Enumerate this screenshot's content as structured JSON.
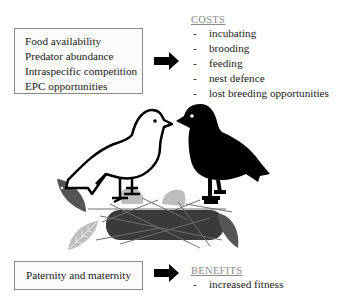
{
  "factors_box": {
    "items": [
      "Food availability",
      "Predator abundance",
      "Intraspecific competition",
      "EPC opportunities"
    ]
  },
  "costs": {
    "heading": "COSTS",
    "items": [
      "incubating",
      "brooding",
      "feeding",
      "nest defence",
      "lost breeding opportunities"
    ]
  },
  "parental_box": {
    "label": "Paternity and maternity"
  },
  "benefits": {
    "heading": "BENEFITS",
    "items": [
      "increased fitness"
    ]
  },
  "illustration": {
    "left_bird": "white outlined bird facing right",
    "right_bird": "black silhouette bird facing left",
    "nest": "dark grey nest with twigs and leaves"
  },
  "symbols": {
    "dash": "-"
  },
  "colors": {
    "heading": "#8a8a8a",
    "box_border": "#8a8a8a",
    "arrow": "#000000",
    "nest": "#3a3a3a",
    "leaf_dark": "#555555",
    "leaf_light": "#bdbdbd"
  }
}
